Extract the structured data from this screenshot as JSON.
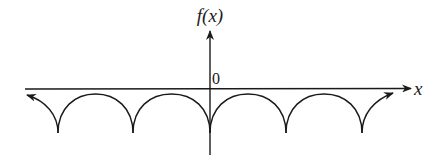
{
  "diagram": {
    "y_axis_label": "f(x)",
    "x_axis_label": "x",
    "origin_label": "0",
    "stroke_color": "#1a1a1a",
    "background_color": "#ffffff"
  },
  "geometry": {
    "origin": [
      210,
      89
    ],
    "cusp_x": [
      58,
      133,
      210,
      286,
      362
    ],
    "cusp_y": 133,
    "arc_top_y": 94
  }
}
